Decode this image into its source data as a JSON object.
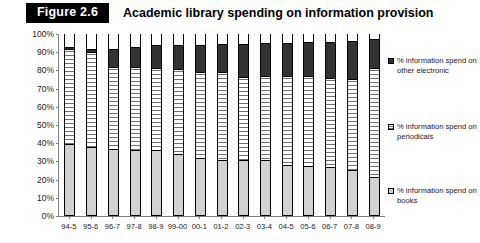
{
  "header": {
    "figure_tag": "Figure 2.6",
    "title": "Academic library spending on information provision"
  },
  "chart_data": {
    "type": "bar",
    "stacked": true,
    "stack_mode": "percent",
    "title": "Academic library spending on information provision",
    "xlabel": "",
    "ylabel": "",
    "ylim": [
      0,
      100
    ],
    "ytick_labels": [
      "100%",
      "90%",
      "80%",
      "70%",
      "60%",
      "50%",
      "40%",
      "30%",
      "20%",
      "10%",
      "0%"
    ],
    "ytick_values": [
      100,
      90,
      80,
      70,
      60,
      50,
      40,
      30,
      20,
      10,
      0
    ],
    "grid": false,
    "legend_position": "right",
    "categories": [
      "94-5",
      "95-6",
      "96-7",
      "97-8",
      "98-9",
      "99-00",
      "00-1",
      "01-2",
      "02-3",
      "03-4",
      "04-5",
      "05-6",
      "06-7",
      "07-8",
      "08-9"
    ],
    "series": [
      {
        "name": "% information spend on books",
        "color": "#d2d2d2",
        "pattern": "solid-light-grey",
        "values": [
          39,
          37.5,
          36,
          35.5,
          35.5,
          33.5,
          31.5,
          30.5,
          30.5,
          30.5,
          27.5,
          27,
          26.5,
          25,
          21
        ]
      },
      {
        "name": "% information spend on periodicals",
        "color": "#ffffff",
        "pattern": "horizontal-hatch",
        "values": [
          52,
          52,
          45.5,
          46,
          45.5,
          46.5,
          47,
          48,
          45.5,
          46,
          49,
          49.5,
          49,
          49.5,
          60
        ]
      },
      {
        "name": "% information spend on other electronic",
        "color": "#333333",
        "pattern": "solid-dark",
        "values": [
          2,
          2.5,
          10.5,
          11.5,
          13,
          14,
          15.5,
          16,
          18.5,
          18.5,
          18.5,
          19,
          20,
          21.5,
          16
        ]
      }
    ],
    "series_totals": [
      93,
      92,
      92,
      93,
      94,
      94,
      94,
      94.5,
      94.5,
      95,
      95,
      95.5,
      95.5,
      96,
      97
    ]
  },
  "legend": {
    "entries": [
      {
        "label": "% information spend on other electronic",
        "swatch": "seg-electronic-swatch"
      },
      {
        "label": "% information spend on periodicals",
        "swatch": "seg-periodicals-swatch"
      },
      {
        "label": "% information spend on books",
        "swatch": "seg-books-swatch"
      }
    ]
  }
}
